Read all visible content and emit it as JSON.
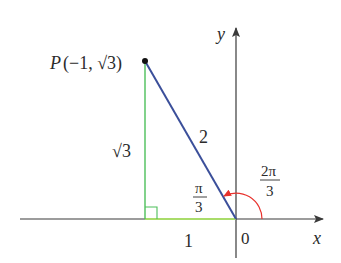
{
  "diagram": {
    "type": "unit-triangle-angle",
    "colors": {
      "axis": "#3a3a3a",
      "hypotenuse": "#3b4f9a",
      "legs": "#4cbf5a",
      "base_highlight": "#a9dc6a",
      "angle_arc": "#e8322d",
      "point": "#111111"
    },
    "axes": {
      "x_label": "x",
      "y_label": "y",
      "origin_label": "0"
    },
    "point": {
      "name": "P",
      "label": "P(−1, √3)",
      "coords": [
        -1,
        "√3"
      ]
    },
    "segments": {
      "hypotenuse_label": "2",
      "vertical_leg_label": "√3",
      "horizontal_leg_label": "1"
    },
    "angles": {
      "reference_angle": {
        "numerator": "π",
        "denominator": "3"
      },
      "standard_angle": {
        "numerator": "2π",
        "denominator": "3"
      }
    },
    "markers": {
      "right_angle": true
    }
  }
}
